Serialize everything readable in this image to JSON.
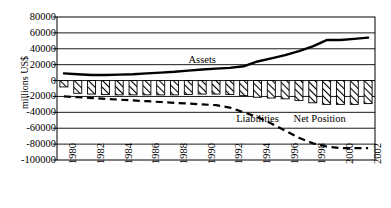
{
  "chart_data": {
    "type": "bar",
    "title": "",
    "xlabel": "",
    "ylabel": "millions US$",
    "ylim": [
      -100000,
      80000
    ],
    "ytick_step": 20000,
    "grid": true,
    "legend_position": "inline-annotations",
    "x": [
      1980,
      1981,
      1982,
      1983,
      1984,
      1985,
      1986,
      1987,
      1988,
      1989,
      1990,
      1991,
      1992,
      1993,
      1994,
      1995,
      1996,
      1997,
      1998,
      1999,
      2000,
      2001,
      2002
    ],
    "xticklabels": [
      "1980",
      "1982",
      "1984",
      "1986",
      "1988",
      "1990",
      "1992",
      "1994",
      "1996",
      "1998",
      "2000",
      "2002"
    ],
    "yticklabels": [
      "80000",
      "60000",
      "40000",
      "20000",
      "0",
      "-20000",
      "-40000",
      "-60000",
      "-80000",
      "-100000"
    ],
    "ytickvalues": [
      80000,
      60000,
      40000,
      20000,
      0,
      -20000,
      -40000,
      -60000,
      -80000,
      -100000
    ],
    "series": [
      {
        "name": "Assets",
        "type": "line",
        "style": "solid",
        "color": "#000000",
        "values": [
          9000,
          8000,
          7000,
          7000,
          7500,
          8000,
          9000,
          10000,
          11000,
          12500,
          14000,
          15000,
          16000,
          18000,
          24000,
          28000,
          32000,
          37000,
          43000,
          51000,
          51000,
          52500,
          54000
        ]
      },
      {
        "name": "Liabilities",
        "type": "line",
        "style": "dashed",
        "color": "#000000",
        "values": [
          -20000,
          -21000,
          -22000,
          -23000,
          -24000,
          -25000,
          -26000,
          -27000,
          -28000,
          -29000,
          -30000,
          -31000,
          -34000,
          -40000,
          -46000,
          -54000,
          -63000,
          -72000,
          -79000,
          -83000,
          -85000,
          -85000,
          -85000
        ]
      },
      {
        "name": "Net Position",
        "type": "bar",
        "style": "hatched",
        "color": "#ffffff",
        "values": [
          -8000,
          -16000,
          -17000,
          -17500,
          -18000,
          -18000,
          -18000,
          -18000,
          -18000,
          -17500,
          -17000,
          -17000,
          -17500,
          -19000,
          -21000,
          -22000,
          -23000,
          -25000,
          -28000,
          -30000,
          -30000,
          -30000,
          -29000
        ]
      }
    ],
    "annotations": [
      {
        "text": "Assets",
        "x": 1990,
        "y": 26000
      },
      {
        "text": "Liabilities",
        "x": 1994,
        "y": -49000
      },
      {
        "text": "Net Position",
        "x": 1998.5,
        "y": -49000
      }
    ]
  }
}
